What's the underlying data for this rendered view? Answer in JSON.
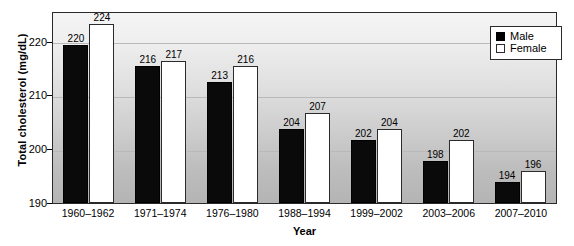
{
  "chart_data": {
    "type": "bar",
    "title": "",
    "xlabel": "Year",
    "ylabel": "Total cholesterol (mg/dL)",
    "categories": [
      "1960–1962",
      "1971–1974",
      "1976–1980",
      "1988–1994",
      "1999–2002",
      "2003–2006",
      "2007–2010"
    ],
    "series": [
      {
        "name": "Male",
        "color": "#000000",
        "values": [
          220,
          216,
          213,
          204,
          202,
          198,
          194
        ]
      },
      {
        "name": "Female",
        "color": "#ffffff",
        "values": [
          224,
          217,
          216,
          207,
          204,
          202,
          196
        ]
      }
    ],
    "ylim": [
      190,
      226
    ],
    "yticks": [
      190,
      200,
      210,
      220
    ],
    "grid": true,
    "legend_position": "top-right"
  },
  "legend": {
    "items": [
      {
        "label": "Male"
      },
      {
        "label": "Female"
      }
    ]
  },
  "yaxis": {
    "ticks": [
      {
        "label": "220"
      },
      {
        "label": "210"
      },
      {
        "label": "200"
      },
      {
        "label": "190"
      }
    ]
  }
}
